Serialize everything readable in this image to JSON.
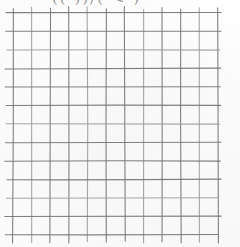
{
  "page": {
    "width": 240,
    "height": 247,
    "background_color": "#fdfdfd"
  },
  "header": {
    "clipped_text": "(( ))/(  < )",
    "legible": false,
    "note": "handwriting clipped by top edge of image"
  },
  "grid": {
    "columns": 11,
    "rows": 12,
    "vertical_line_count": 12,
    "horizontal_line_count": 13,
    "left": 13,
    "top": 13,
    "right": 218,
    "bottom": 235,
    "cell_width": 18.6,
    "cell_height": 18.5,
    "line_color": "#6f6f6f",
    "line_color_light": "#9a9a9a",
    "line_width": 1.1,
    "overshoot_top": 5,
    "overshoot_bottom": 7,
    "style": "hand-drawn"
  },
  "chart_data": {
    "type": "table",
    "title": "",
    "xlabel": "",
    "ylabel": "",
    "columns": 11,
    "rows": 12,
    "grid": true,
    "values": [],
    "note": "empty grid / graph paper with no plotted data"
  }
}
